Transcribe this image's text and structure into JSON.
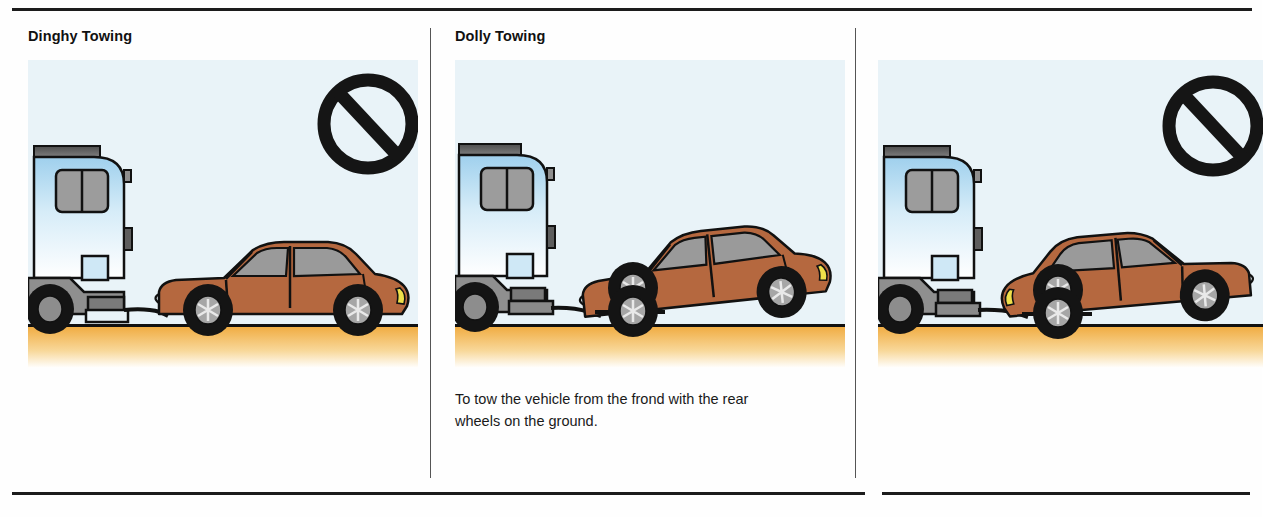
{
  "panels": [
    {
      "title": "Dinghy Towing",
      "caption": "",
      "prohibited": true,
      "icon": "prohibition-icon",
      "scene": "rv-towing-car-four-wheels-down"
    },
    {
      "title": "Dolly Towing",
      "caption": "To tow the vehicle from the frond with the rear wheels on the ground.",
      "prohibited": false,
      "icon": "",
      "scene": "rv-towing-car-front-wheels-on-dolly"
    },
    {
      "title": "",
      "caption": "",
      "prohibited": true,
      "icon": "prohibition-icon",
      "scene": "rv-towing-car-reversed-front-wheels-on-dolly"
    }
  ],
  "colors": {
    "panel_background": "#e9f3f8",
    "rv_body_top": "#a8d4ee",
    "rv_body_bottom": "#ffffff",
    "rv_roof_gray": "#5a5a5a",
    "rv_lower_gray": "#8f8f8f",
    "car_body": "#b5683f",
    "car_window_gray": "#9a9a9a",
    "ground_top": "#f0a93c",
    "ground_bottom": "#ffffff",
    "outline": "#111111",
    "rule": "#1c1c1c",
    "divider": "#555555",
    "headlight_yellow": "#efe04a"
  }
}
